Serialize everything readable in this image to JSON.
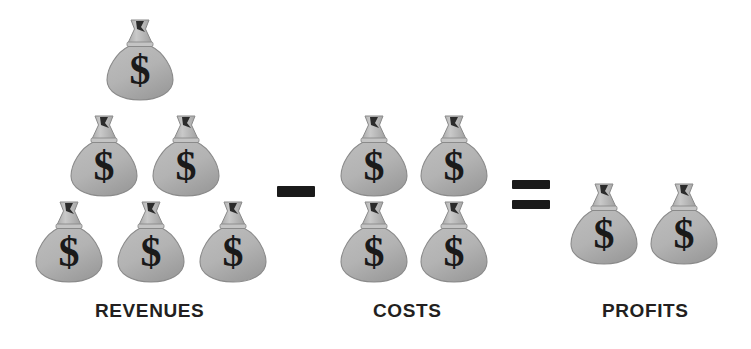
{
  "diagram": {
    "equation": "REVENUES - COSTS = PROFITS",
    "bag_icon": "money-bag-icon",
    "bag_symbol": "$",
    "colors": {
      "bag_fill": "#b3b3b3",
      "bag_shade": "#9d9d9d",
      "bag_outline": "#8a8a8a",
      "tie_fill": "#c9c9c9",
      "symbol": "#1a1a1a",
      "operator": "#1a1a1a",
      "label_text": "#231f20",
      "background": "#ffffff"
    },
    "groups": [
      {
        "id": "revenues",
        "label": "REVENUES",
        "count": 6,
        "arrangement": "pyramid 1-2-3",
        "bags": [
          {
            "x": 104,
            "y": 16
          },
          {
            "x": 68,
            "y": 112
          },
          {
            "x": 150,
            "y": 112
          },
          {
            "x": 33,
            "y": 198
          },
          {
            "x": 115,
            "y": 198
          },
          {
            "x": 197,
            "y": 198
          }
        ]
      },
      {
        "id": "costs",
        "label": "COSTS",
        "count": 4,
        "arrangement": "grid 2x2",
        "bags": [
          {
            "x": 338,
            "y": 112
          },
          {
            "x": 418,
            "y": 112
          },
          {
            "x": 338,
            "y": 198
          },
          {
            "x": 418,
            "y": 198
          }
        ]
      },
      {
        "id": "profits",
        "label": "PROFITS",
        "count": 2,
        "arrangement": "row of 2",
        "bags": [
          {
            "x": 568,
            "y": 180
          },
          {
            "x": 648,
            "y": 180
          }
        ]
      }
    ],
    "operators": [
      {
        "id": "minus",
        "name": "minus-operator",
        "glyph": "-",
        "between": "revenues-costs"
      },
      {
        "id": "equals",
        "name": "equals-operator",
        "glyph": "=",
        "between": "costs-profits"
      }
    ]
  }
}
